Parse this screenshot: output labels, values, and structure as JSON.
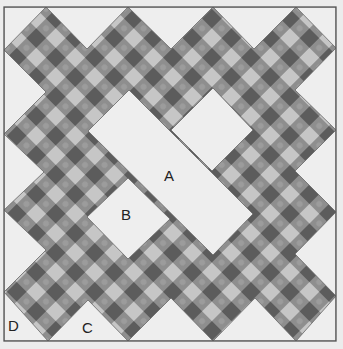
{
  "figure": {
    "type": "quilt-block-diagram",
    "labels": {
      "A": "A",
      "B": "B",
      "C": "C",
      "D": "D"
    },
    "colors": {
      "background": "#ececec",
      "frame": "#555555",
      "plain_piece": "#eeeeee",
      "checker_dark": "#5c5c5c",
      "checker_medium": "#8e8e8e",
      "checker_light": "#c6c6c6"
    }
  }
}
